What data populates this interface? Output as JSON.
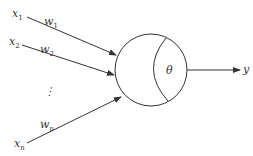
{
  "diagram": {
    "inputs": [
      {
        "label": "x",
        "sub": "1",
        "weight": "w",
        "weight_sub": "1"
      },
      {
        "label": "x",
        "sub": "2",
        "weight": "w",
        "weight_sub": "2"
      },
      {
        "label": "x",
        "sub": "n",
        "weight": "w",
        "weight_sub": "n"
      }
    ],
    "ellipsis": "⋮",
    "threshold": "θ",
    "output": "y",
    "colors": {
      "stroke": "#333333",
      "background": "#ffffff"
    }
  }
}
